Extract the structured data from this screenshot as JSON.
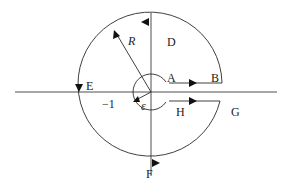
{
  "diagram": {
    "type": "keyhole-contour",
    "colors": {
      "line": "#2a2a2a",
      "axis": "#3a3a3a",
      "text": "#1a1a1a",
      "background": "#ffffff"
    },
    "labels": {
      "A": "A",
      "B": "B",
      "D": "D",
      "E": "E",
      "F": "F",
      "G": "G",
      "H": "H",
      "R": "R",
      "epsilon": "ε",
      "minus_one": "−1"
    }
  }
}
